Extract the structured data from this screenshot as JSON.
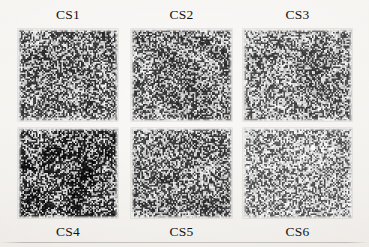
{
  "figure": {
    "type": "micrograph-panel-grid",
    "background_color": "#f4f2ef",
    "label_color": "#151413",
    "rows": 2,
    "columns": 3,
    "panels": [
      {
        "id": "cs1",
        "label": "CS1",
        "label_position": "top",
        "row": 1,
        "column": 1,
        "texture": {
          "kind": "speckle-noise",
          "density": 0.52,
          "mean_gray": 150,
          "contrast": 0.86,
          "grain": 1.0,
          "blotch_strength": 0.3,
          "seed": 11
        }
      },
      {
        "id": "cs2",
        "label": "CS2",
        "label_position": "top",
        "row": 1,
        "column": 2,
        "texture": {
          "kind": "speckle-noise",
          "density": 0.5,
          "mean_gray": 152,
          "contrast": 0.84,
          "grain": 1.0,
          "blotch_strength": 0.34,
          "seed": 22
        }
      },
      {
        "id": "cs3",
        "label": "CS3",
        "label_position": "top",
        "row": 1,
        "column": 3,
        "texture": {
          "kind": "speckle-noise",
          "density": 0.47,
          "mean_gray": 158,
          "contrast": 0.8,
          "grain": 1.0,
          "blotch_strength": 0.24,
          "seed": 33
        }
      },
      {
        "id": "cs4",
        "label": "CS4",
        "label_position": "bottom",
        "row": 2,
        "column": 1,
        "texture": {
          "kind": "speckle-noise",
          "density": 0.6,
          "mean_gray": 132,
          "contrast": 0.94,
          "grain": 1.15,
          "blotch_strength": 0.42,
          "seed": 44
        }
      },
      {
        "id": "cs5",
        "label": "CS5",
        "label_position": "bottom",
        "row": 2,
        "column": 2,
        "texture": {
          "kind": "speckle-noise",
          "density": 0.5,
          "mean_gray": 150,
          "contrast": 0.84,
          "grain": 1.0,
          "blotch_strength": 0.26,
          "seed": 55
        }
      },
      {
        "id": "cs6",
        "label": "CS6",
        "label_position": "bottom",
        "row": 2,
        "column": 3,
        "texture": {
          "kind": "speckle-noise",
          "density": 0.42,
          "mean_gray": 170,
          "contrast": 0.76,
          "grain": 0.95,
          "blotch_strength": 0.18,
          "seed": 66
        }
      }
    ]
  }
}
